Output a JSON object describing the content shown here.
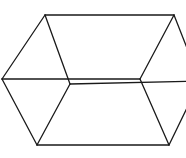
{
  "diagram": {
    "type": "wireframe-box",
    "stroke_color": "#1a1a1a",
    "background": "#ffffff",
    "vertices": {
      "top_left": [
        45,
        15
      ],
      "top_right": [
        174,
        15
      ],
      "left": [
        2,
        79
      ],
      "right": [
        200,
        81
      ],
      "inner_left": [
        70,
        84
      ],
      "inner_right": [
        140,
        79
      ],
      "bottom_left": [
        37,
        145
      ],
      "bottom_right": [
        169,
        145
      ]
    },
    "edges": [
      {
        "from": "top_left",
        "to": "top_right"
      },
      {
        "from": "top_left",
        "to": "left"
      },
      {
        "from": "top_left",
        "to": "inner_left"
      },
      {
        "from": "top_right",
        "to": "inner_right"
      },
      {
        "from": "top_right",
        "to": "right"
      },
      {
        "from": "left",
        "to": "inner_right"
      },
      {
        "from": "left",
        "to": "bottom_left"
      },
      {
        "from": "inner_left",
        "to": "bottom_left"
      },
      {
        "from": "inner_left",
        "to": "right"
      },
      {
        "from": "inner_right",
        "to": "bottom_right"
      },
      {
        "from": "bottom_left",
        "to": "bottom_right"
      },
      {
        "from": "bottom_right",
        "to": "right"
      }
    ]
  }
}
